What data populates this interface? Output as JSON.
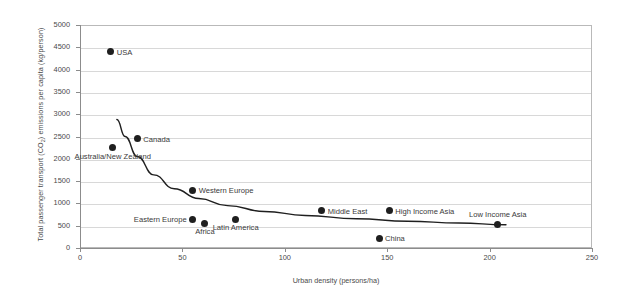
{
  "chart_data": {
    "type": "scatter",
    "title": "",
    "xlabel": "Urban density (persons/ha)",
    "ylabel": "Total passenger transport (CO2) emissions per capita (kg/person)",
    "ylabel_parts": {
      "before": "Total passenger transport (CO",
      "sub": "2",
      "after": ") emissions per capita (kg/person)"
    },
    "xlim": [
      0,
      250
    ],
    "ylim": [
      0,
      5000
    ],
    "xticks": [
      0,
      50,
      100,
      150,
      200,
      250
    ],
    "yticks": [
      0,
      500,
      1000,
      1500,
      2000,
      2500,
      3000,
      3500,
      4000,
      4500,
      5000
    ],
    "xtick_labels": [
      "0",
      "50",
      "100",
      "150",
      "200",
      "250"
    ],
    "ytick_labels": [
      "0",
      "500",
      "1000",
      "1500",
      "2000",
      "2500",
      "3000",
      "3500",
      "4000",
      "4500",
      "5000"
    ],
    "grid": "horizontal",
    "legend": "none",
    "marker_color": "#1f1f1f",
    "grid_color": "#d8d8d8",
    "axis_color": "#8c8c8c",
    "curve_color": "#1f1f1f",
    "points": [
      {
        "label": "USA",
        "x": 15,
        "y": 4400,
        "label_pos": "right"
      },
      {
        "label": "Canada",
        "x": 28,
        "y": 2450,
        "label_pos": "right"
      },
      {
        "label": "Australia/New Zealand",
        "x": 16,
        "y": 2250,
        "label_pos": "below"
      },
      {
        "label": "Western Europe",
        "x": 55,
        "y": 1300,
        "label_pos": "right"
      },
      {
        "label": "Eastern Europe",
        "x": 55,
        "y": 650,
        "label_pos": "left"
      },
      {
        "label": "Africa",
        "x": 61,
        "y": 550,
        "label_pos": "below"
      },
      {
        "label": "Latin America",
        "x": 76,
        "y": 650,
        "label_pos": "below"
      },
      {
        "label": "Middle East",
        "x": 118,
        "y": 830,
        "label_pos": "right"
      },
      {
        "label": "High Income Asia",
        "x": 151,
        "y": 830,
        "label_pos": "right"
      },
      {
        "label": "China",
        "x": 146,
        "y": 220,
        "label_pos": "right"
      },
      {
        "label": "Low Income Asia",
        "x": 204,
        "y": 520,
        "label_pos": "above"
      }
    ],
    "trend_curve": {
      "description": "decaying power-law fit line",
      "points": [
        {
          "x": 18,
          "y": 2880
        },
        {
          "x": 22,
          "y": 2500
        },
        {
          "x": 28,
          "y": 2050
        },
        {
          "x": 36,
          "y": 1640
        },
        {
          "x": 46,
          "y": 1330
        },
        {
          "x": 58,
          "y": 1110
        },
        {
          "x": 72,
          "y": 950
        },
        {
          "x": 90,
          "y": 820
        },
        {
          "x": 110,
          "y": 730
        },
        {
          "x": 135,
          "y": 655
        },
        {
          "x": 160,
          "y": 600
        },
        {
          "x": 185,
          "y": 560
        },
        {
          "x": 208,
          "y": 520
        }
      ]
    }
  }
}
